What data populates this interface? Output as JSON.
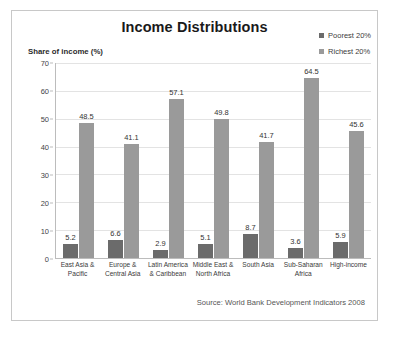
{
  "card": {
    "title": "Income Distributions",
    "ylabel": "Share of income (%)",
    "source": "Source: World Bank Development Indicators 2008"
  },
  "legend": {
    "items": [
      {
        "label": "Poorest 20%",
        "color": "#6b6b6b"
      },
      {
        "label": "Richest 20%",
        "color": "#9a9a9a"
      }
    ]
  },
  "axis": {
    "ticks": [
      "70",
      "60",
      "50",
      "40",
      "30",
      "20",
      "10",
      "0"
    ]
  },
  "chart_data": {
    "type": "bar",
    "title": "Income Distributions",
    "xlabel": "",
    "ylabel": "Share of income (%)",
    "ylim": [
      0,
      70
    ],
    "ytick_step": 10,
    "grid": true,
    "legend_position": "top-right",
    "annotation": "Source: World Bank Development Indicators 2008",
    "categories": [
      "East Asia & Pacific",
      "Europe & Central Asia",
      "Latin America & Caribbean",
      "Middle East & North Africa",
      "South Asia",
      "Sub-Saharan Africa",
      "High-income"
    ],
    "category_lines": [
      [
        "East Asia &",
        "Pacific"
      ],
      [
        "Europe &",
        "Central Asia"
      ],
      [
        "Latin America",
        "& Caribbean"
      ],
      [
        "Middle East &",
        "North Africa"
      ],
      [
        "South Asia",
        ""
      ],
      [
        "Sub-Saharan",
        "Africa"
      ],
      [
        "High-income",
        ""
      ]
    ],
    "series": [
      {
        "name": "Poorest 20%",
        "color": "#6b6b6b",
        "values": [
          5.2,
          6.6,
          2.9,
          5.1,
          8.7,
          3.6,
          5.9
        ]
      },
      {
        "name": "Richest 20%",
        "color": "#9a9a9a",
        "values": [
          48.5,
          41.1,
          57.1,
          49.8,
          41.7,
          64.5,
          45.6
        ]
      }
    ]
  }
}
